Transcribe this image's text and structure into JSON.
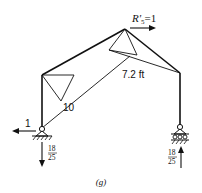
{
  "figure": {
    "caption": "(g)",
    "labels": {
      "reaction_top": "R'",
      "reaction_top_sub": "5",
      "reaction_top_value": "=1",
      "length": "7.2 ft",
      "left_triangle_value": "10",
      "left_horizontal": "1",
      "left_vertical_num": "18",
      "left_vertical_den": "25",
      "right_vertical_num": "18",
      "right_vertical_den": "25"
    },
    "colors": {
      "stroke": "#111111",
      "background": "#ffffff"
    }
  }
}
